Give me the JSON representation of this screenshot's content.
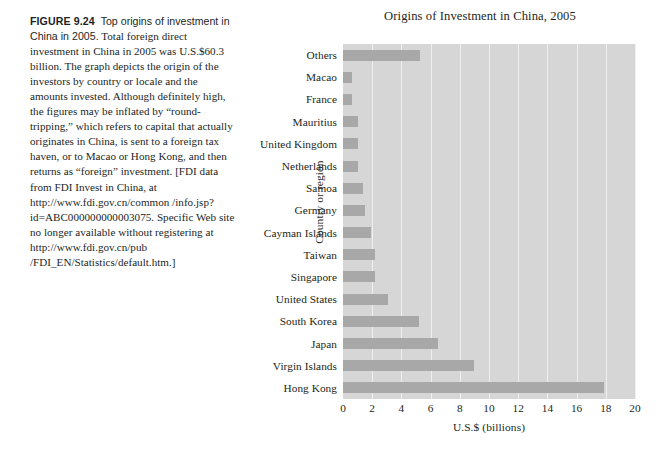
{
  "figure": {
    "label": "FIGURE 9.24",
    "lead": "Top origins of investment in China in 2005.",
    "body": " Total foreign direct investment in China in 2005 was U.S.$60.3 billion. The graph depicts the origin of the investors by country or locale and the amounts invested. Although definitely high, the figures may be inflated by “round-tripping,” which refers to capital that actually originates in China, is sent to a foreign tax haven, or to Macao or Hong Kong, and then returns as “foreign” investment. [FDI data from FDI Invest in China, at http://www.fdi.gov.cn/common /info.jsp?id=ABC000000000003075. Specific Web site no longer available without registering at http://www.fdi.gov.cn/pub /FDI_EN/Statistics/default.htm.]"
  },
  "chart_data": {
    "type": "bar",
    "orientation": "horizontal",
    "title": "Origins of Investment in China, 2005",
    "xlabel": "U.S.$ (billions)",
    "ylabel": "Country or region",
    "xlim": [
      0,
      20
    ],
    "xticks": [
      0,
      2,
      4,
      6,
      8,
      10,
      12,
      14,
      16,
      18,
      20
    ],
    "grid": true,
    "legend": null,
    "plot_background": "#d6d6d6",
    "bar_color": "#a8a8a8",
    "categories": [
      "Others",
      "Macao",
      "France",
      "Mauritius",
      "United Kingdom",
      "Netherlands",
      "Samoa",
      "Germany",
      "Cayman Islands",
      "Taiwan",
      "Singapore",
      "United States",
      "South Korea",
      "Japan",
      "Virgin Islands",
      "Hong Kong"
    ],
    "values": [
      5.3,
      0.6,
      0.6,
      1.0,
      1.0,
      1.0,
      1.4,
      1.5,
      1.9,
      2.2,
      2.2,
      3.1,
      5.2,
      6.5,
      9.0,
      17.9
    ]
  }
}
